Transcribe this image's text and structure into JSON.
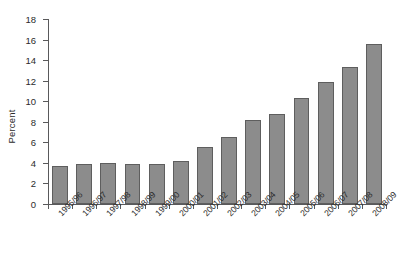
{
  "chart_data": {
    "type": "bar",
    "title": "",
    "xlabel": "",
    "ylabel": "Percent",
    "ylim": [
      0,
      18
    ],
    "yticks": [
      0,
      2,
      4,
      6,
      8,
      10,
      12,
      14,
      16,
      18
    ],
    "grid": false,
    "legend": null,
    "categories": [
      "1995/96",
      "1996/97",
      "1997/98",
      "1998/99",
      "1999/00",
      "2000/01",
      "2001/02",
      "2002/03",
      "2003/04",
      "2004/05",
      "2005/06",
      "2006/07",
      "2007/08",
      "2008/09"
    ],
    "values": [
      3.7,
      3.9,
      4.0,
      3.9,
      3.9,
      4.2,
      5.5,
      6.5,
      8.2,
      8.8,
      10.3,
      11.9,
      13.3,
      15.6
    ],
    "bar_color": "#8c8c8c",
    "bar_edge_color": "#5e5e5e",
    "axis_color": "#59595b",
    "text_color": "#2b2b2b"
  },
  "caption": {
    "fragment": ""
  }
}
